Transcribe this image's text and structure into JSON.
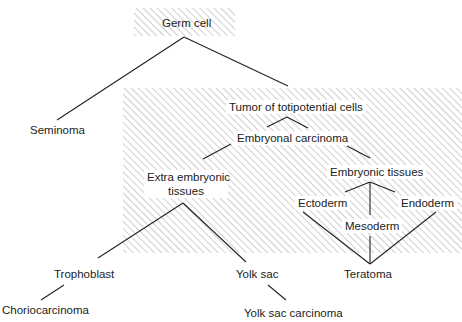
{
  "diagram": {
    "root": "Germ cell",
    "nodes": {
      "germ_cell": "Germ cell",
      "seminoma": "Seminoma",
      "tumor_totipotent": "Tumor of totipotential cells",
      "embryonal_carcinoma": "Embryonal carcinoma",
      "extra_embryonic_1": "Extra embryonic",
      "extra_embryonic_2": "tissues",
      "embryonic_tissues": "Embryonic tissues",
      "ectoderm": "Ectoderm",
      "mesoderm": "Mesoderm",
      "endoderm": "Endoderm",
      "trophoblast": "Trophoblast",
      "yolk_sac": "Yolk sac",
      "teratoma": "Teratoma",
      "choriocarcinoma": "Choriocarcinoma",
      "yolk_sac_carcinoma": "Yolk sac carcinoma"
    },
    "edges": [
      [
        "Germ cell",
        "Seminoma"
      ],
      [
        "Germ cell",
        "Tumor of totipotential cells"
      ],
      [
        "Tumor of totipotential cells",
        "Embryonal carcinoma"
      ],
      [
        "Embryonal carcinoma",
        "Extra embryonic tissues"
      ],
      [
        "Embryonal carcinoma",
        "Embryonic tissues"
      ],
      [
        "Embryonic tissues",
        "Ectoderm"
      ],
      [
        "Embryonic tissues",
        "Mesoderm"
      ],
      [
        "Embryonic tissues",
        "Endoderm"
      ],
      [
        "Extra embryonic tissues",
        "Trophoblast"
      ],
      [
        "Extra embryonic tissues",
        "Yolk sac"
      ],
      [
        "Ectoderm",
        "Teratoma"
      ],
      [
        "Mesoderm",
        "Teratoma"
      ],
      [
        "Endoderm",
        "Teratoma"
      ],
      [
        "Trophoblast",
        "Choriocarcinoma"
      ],
      [
        "Yolk sac",
        "Yolk sac carcinoma"
      ]
    ],
    "colors": {
      "line": "#222222",
      "hatch": "#999999",
      "text": "#222222"
    }
  }
}
